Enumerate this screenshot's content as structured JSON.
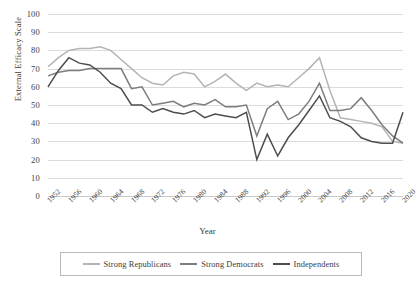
{
  "chart_data": {
    "type": "line",
    "title": "",
    "xlabel": "Year",
    "ylabel": "External Efficacy Scale",
    "ylim": [
      0,
      100
    ],
    "ytick_step": 10,
    "yticks": [
      "100",
      "90",
      "80",
      "70",
      "60",
      "50",
      "40",
      "30",
      "20",
      "10",
      "0"
    ],
    "grid": true,
    "legend_position": "bottom",
    "x": [
      1952,
      1954,
      1956,
      1958,
      1960,
      1962,
      1964,
      1966,
      1968,
      1970,
      1972,
      1974,
      1976,
      1978,
      1980,
      1982,
      1984,
      1986,
      1988,
      1990,
      1992,
      1994,
      1996,
      1998,
      2000,
      2002,
      2004,
      2006,
      2008,
      2010,
      2012,
      2014,
      2016,
      2018,
      2020
    ],
    "xticks": [
      "1952",
      "1956",
      "1960",
      "1964",
      "1968",
      "1972",
      "1976",
      "1980",
      "1984",
      "1988",
      "1992",
      "1996",
      "2000",
      "2004",
      "2008",
      "2012",
      "2016",
      "2020"
    ],
    "xtick_years": [
      1952,
      1956,
      1960,
      1964,
      1968,
      1972,
      1976,
      1980,
      1984,
      1988,
      1992,
      1996,
      2000,
      2004,
      2008,
      2012,
      2016,
      2020
    ],
    "series": [
      {
        "name": "Strong Republicans",
        "color": "#b4b4b4",
        "values": [
          71,
          76,
          80,
          81,
          81,
          82,
          80,
          75,
          70,
          65,
          62,
          61,
          66,
          68,
          67,
          60,
          63,
          67,
          62,
          58,
          62,
          60,
          61,
          60,
          65,
          70,
          76,
          58,
          43,
          42,
          41,
          40,
          38,
          30,
          29
        ]
      },
      {
        "name": "Strong Democrats",
        "color": "#7d7d7d",
        "values": [
          66,
          68,
          69,
          69,
          70,
          70,
          70,
          70,
          59,
          60,
          50,
          51,
          52,
          49,
          51,
          50,
          53,
          49,
          49,
          50,
          33,
          48,
          52,
          42,
          45,
          52,
          62,
          47,
          47,
          48,
          54,
          47,
          39,
          33,
          29
        ]
      },
      {
        "name": "Independents",
        "color": "#4d4d4d",
        "values": [
          60,
          69,
          76,
          73,
          72,
          68,
          62,
          59,
          50,
          50,
          46,
          48,
          46,
          45,
          47,
          43,
          45,
          44,
          43,
          46,
          20,
          34,
          22,
          32,
          39,
          47,
          55,
          43,
          41,
          38,
          32,
          30,
          29,
          29,
          46
        ]
      }
    ]
  },
  "legend": {
    "entries": [
      {
        "label": "Strong Republicans"
      },
      {
        "label": "Strong Democrats"
      },
      {
        "label": "Independents"
      }
    ]
  }
}
